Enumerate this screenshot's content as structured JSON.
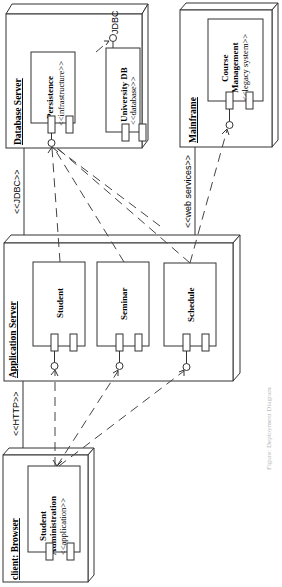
{
  "nodes": {
    "database_server": {
      "label": "Database Server"
    },
    "mainframe": {
      "label": "Mainframe"
    },
    "application_server": {
      "label": "Application Server"
    },
    "client_browser": {
      "label": "client: Browser"
    }
  },
  "components": {
    "persistence": {
      "name": "Persistence",
      "stereotype": "<<infrastructure>>"
    },
    "university_db": {
      "name": "University DB",
      "stereotype": "<<database>>"
    },
    "course_management": {
      "name_line1": "Course",
      "name_line2": "Management",
      "stereotype": "<<legacy system>>"
    },
    "student": {
      "name": "Student"
    },
    "seminar": {
      "name": "Seminar"
    },
    "schedule": {
      "name": "Schedule"
    },
    "student_administration": {
      "name_line1": "Student",
      "name_line2": "Administration",
      "stereotype": "<<application>>"
    }
  },
  "interfaces": {
    "jdbc_interface": "JDBC"
  },
  "connections": {
    "db_app": "<<JDBC>>",
    "mainframe_app": "<<web services>>",
    "app_client": "<<HTTP>>"
  },
  "caption": "Figure: Deployment Diagram"
}
